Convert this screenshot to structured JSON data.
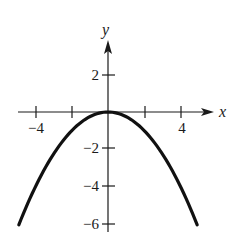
{
  "chart_data": {
    "type": "line",
    "title": "",
    "xlabel": "x",
    "ylabel": "y",
    "function": "y = -x^2/4",
    "x_ticks": [
      -4,
      -2,
      2,
      4
    ],
    "x_tick_labels": [
      "-4",
      "4"
    ],
    "y_ticks": [
      2,
      -2,
      -4,
      -6
    ],
    "y_tick_labels": [
      "2",
      "-2",
      "-4",
      "-6"
    ],
    "xlim": [
      -4.8,
      5.8
    ],
    "ylim": [
      -6.3,
      3.9
    ],
    "grid": false,
    "legend": null,
    "series": [
      {
        "name": "parabola",
        "x": [
          -4.9,
          -4,
          -3,
          -2,
          -1,
          0,
          1,
          2,
          3,
          4,
          4.9
        ],
        "y": [
          -6.0,
          -4,
          -2.25,
          -1,
          -0.25,
          0,
          -0.25,
          -1,
          -2.25,
          -4,
          -6.0
        ]
      }
    ]
  },
  "labels": {
    "x_axis": "x",
    "y_axis": "y",
    "x_neg4": "−4",
    "x_pos4": "4",
    "y_pos2": "2",
    "y_neg2": "−2",
    "y_neg4": "−4",
    "y_neg6": "−6"
  }
}
